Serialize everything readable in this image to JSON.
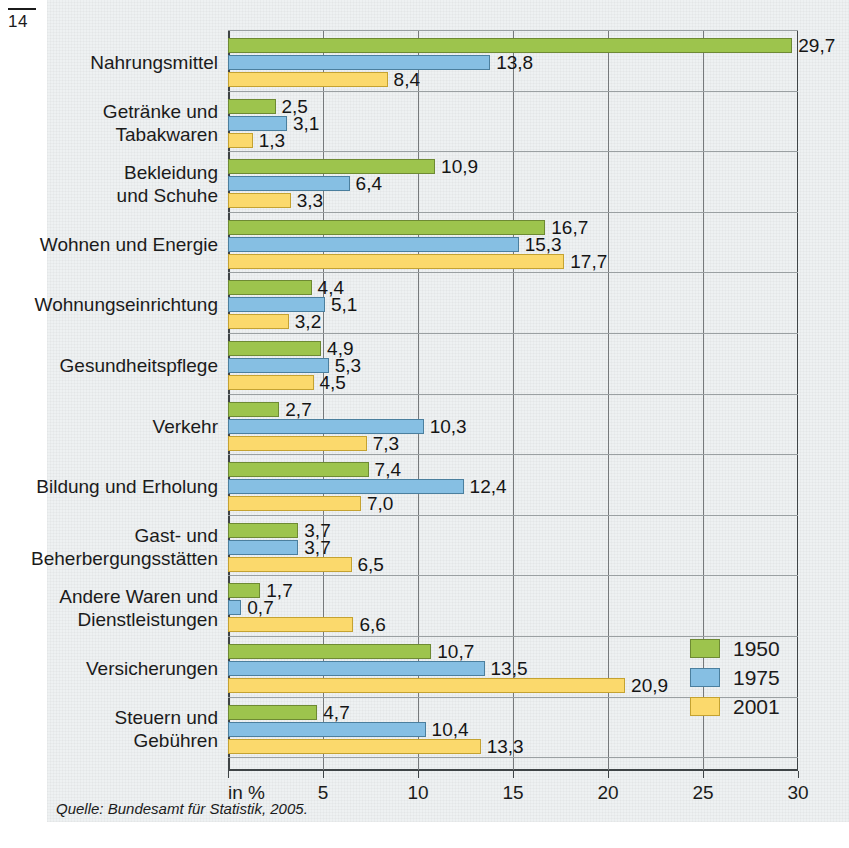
{
  "page": {
    "number": "14",
    "source_note": "Quelle: Bundesamt für Statistik, 2005.",
    "axis_unit_label": "in %"
  },
  "legend": {
    "items": [
      {
        "label": "1950",
        "color": "#9dc44d"
      },
      {
        "label": "1975",
        "color": "#86bfe3"
      },
      {
        "label": "2001",
        "color": "#fbd96c"
      }
    ]
  },
  "chart_data": {
    "type": "bar",
    "orientation": "horizontal",
    "title": "",
    "subtitle": "",
    "xlabel": "in %",
    "ylabel": "",
    "xlim": [
      0,
      30
    ],
    "xticks": [
      0,
      5,
      10,
      15,
      20,
      25,
      30
    ],
    "xticklabels": [
      "",
      "5",
      "10",
      "15",
      "20",
      "25",
      "30"
    ],
    "grid": true,
    "legend_position": "bottom-right",
    "decimal_separator": ",",
    "categories": [
      "Nahrungsmittel",
      "Getränke und Tabakwaren",
      "Bekleidung und Schuhe",
      "Wohnen und Energie",
      "Wohnungseinrichtung",
      "Gesundheitspflege",
      "Verkehr",
      "Bildung und Erholung",
      "Gast- und Beherbergungsstätten",
      "Andere Waren und Dienstleistungen",
      "Versicherungen",
      "Steuern und Gebühren"
    ],
    "category_lines": [
      [
        "Nahrungsmittel"
      ],
      [
        "Getränke und",
        "Tabakwaren"
      ],
      [
        "Bekleidung",
        "und Schuhe"
      ],
      [
        "Wohnen und Energie"
      ],
      [
        "Wohnungseinrichtung"
      ],
      [
        "Gesundheitspflege"
      ],
      [
        "Verkehr"
      ],
      [
        "Bildung und Erholung"
      ],
      [
        "Gast- und",
        "Beherbergungsstätten"
      ],
      [
        "Andere Waren und",
        "Dienstleistungen"
      ],
      [
        "Versicherungen"
      ],
      [
        "Steuern und",
        "Gebühren"
      ]
    ],
    "series": [
      {
        "name": "1950",
        "color": "#9dc44d",
        "values": [
          29.7,
          2.5,
          10.9,
          16.7,
          4.4,
          4.9,
          2.7,
          7.4,
          3.7,
          1.7,
          10.7,
          4.7
        ],
        "labels": [
          "29,7",
          "2,5",
          "10,9",
          "16,7",
          "4,4",
          "4,9",
          "2,7",
          "7,4",
          "3,7",
          "1,7",
          "10,7",
          "4,7"
        ]
      },
      {
        "name": "1975",
        "color": "#86bfe3",
        "values": [
          13.8,
          3.1,
          6.4,
          15.3,
          5.1,
          5.3,
          10.3,
          12.4,
          3.7,
          0.7,
          13.5,
          10.4
        ],
        "labels": [
          "13,8",
          "3,1",
          "6,4",
          "15,3",
          "5,1",
          "5,3",
          "10,3",
          "12,4",
          "3,7",
          "0,7",
          "13,5",
          "10,4"
        ]
      },
      {
        "name": "2001",
        "color": "#fbd96c",
        "values": [
          8.4,
          1.3,
          3.3,
          17.7,
          3.2,
          4.5,
          7.3,
          7.0,
          6.5,
          6.6,
          20.9,
          13.3
        ],
        "labels": [
          "8,4",
          "1,3",
          "3,3",
          "17,7",
          "3,2",
          "4,5",
          "7,3",
          "7,0",
          "6,5",
          "6,6",
          "20,9",
          "13,3"
        ]
      }
    ]
  }
}
